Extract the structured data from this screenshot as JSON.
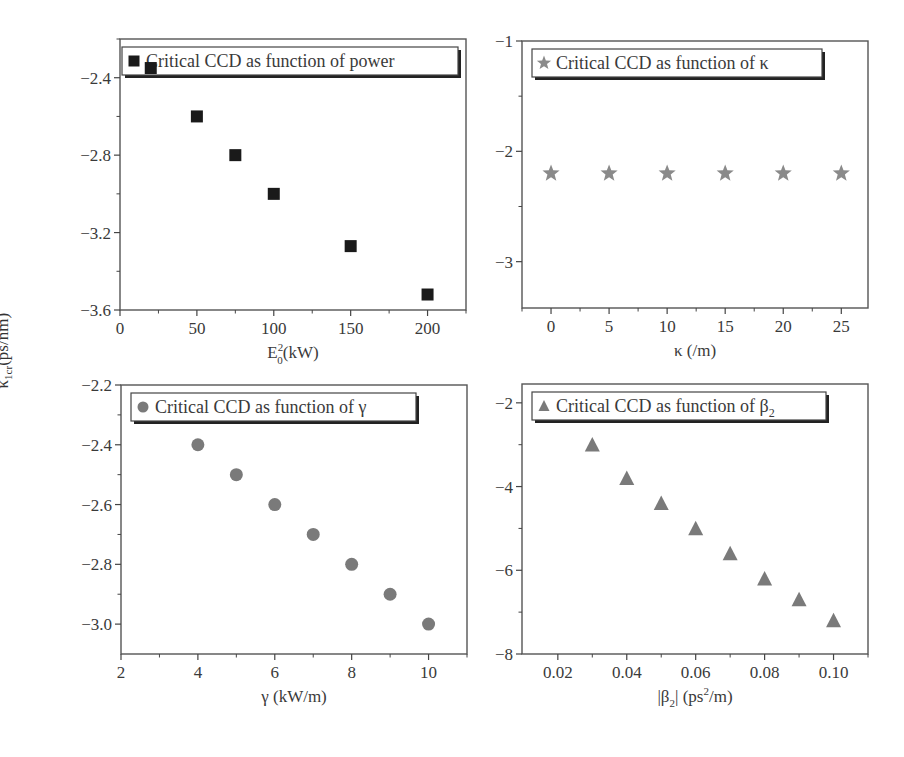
{
  "figure": {
    "shared_ylabel": "κ 1cr(ps/nm)",
    "shared_ylabel_main": "κ",
    "shared_ylabel_sub": "1cr",
    "shared_ylabel_unit": "(ps/nm)"
  },
  "chart_data": [
    {
      "id": "power",
      "type": "scatter",
      "title": "",
      "legend": "Critical CCD as function of power",
      "marker": "square",
      "marker_color": "#1a1a1a",
      "xlabel": "E0²(kW)",
      "xlabel_parts": {
        "base": "E",
        "sub": "0",
        "sup": "2",
        "rest": "(kW)"
      },
      "ylabel": "κ1cr(ps/nm)",
      "x": [
        20,
        50,
        75,
        100,
        150,
        200
      ],
      "y": [
        -2.35,
        -2.6,
        -2.8,
        -3.0,
        -3.27,
        -3.52
      ],
      "xlim": [
        0,
        225
      ],
      "ylim": [
        -3.6,
        -2.2
      ],
      "xticks": [
        0,
        50,
        100,
        150,
        200
      ],
      "xtick_labels": [
        "0",
        "50",
        "100",
        "150",
        "200"
      ],
      "xminor": [
        25,
        75,
        125,
        175,
        225
      ],
      "yticks": [
        -2.4,
        -2.8,
        -3.2,
        -3.6
      ],
      "ytick_labels": [
        "-2.4",
        "-2.8",
        "-3.2",
        "-3.6"
      ],
      "yminor": [
        -2.2,
        -2.6,
        -3.0,
        -3.4
      ],
      "grid": false,
      "legend_position": "top-left",
      "frame": {
        "left": 120,
        "top": 39,
        "right": 466,
        "bottom": 310
      }
    },
    {
      "id": "kappa",
      "type": "scatter",
      "title": "",
      "legend": "Critical CCD as function of κ",
      "marker": "star",
      "marker_color": "#8a8a8a",
      "xlabel": "κ (/m)",
      "ylabel": "κ1cr(ps/nm)",
      "x": [
        0,
        5,
        10,
        15,
        20,
        25
      ],
      "y": [
        -2.2,
        -2.2,
        -2.2,
        -2.2,
        -2.2,
        -2.2
      ],
      "xlim": [
        -2.5,
        27.3
      ],
      "ylim": [
        -3.42,
        -1.0
      ],
      "xticks": [
        0,
        5,
        10,
        15,
        20,
        25
      ],
      "xtick_labels": [
        "0",
        "5",
        "10",
        "15",
        "20",
        "25"
      ],
      "xminor": [
        -2.5,
        2.5,
        7.5,
        12.5,
        17.5,
        22.5
      ],
      "yticks": [
        -1,
        -2,
        -3
      ],
      "ytick_labels": [
        "-1",
        "-2",
        "-3"
      ],
      "yminor": [
        -1.5,
        -2.5
      ],
      "grid": false,
      "legend_position": "top-left",
      "frame": {
        "left": 522,
        "top": 41,
        "right": 868,
        "bottom": 308
      }
    },
    {
      "id": "gamma",
      "type": "scatter",
      "title": "",
      "legend": "Critical CCD as function of γ",
      "marker": "circle",
      "marker_color": "#7a7a7a",
      "xlabel": "γ (kW/m)",
      "ylabel": "κ1cr(ps/nm)",
      "x": [
        4,
        5,
        6,
        7,
        8,
        9,
        10
      ],
      "y": [
        -2.4,
        -2.5,
        -2.6,
        -2.7,
        -2.8,
        -2.9,
        -3.0
      ],
      "xlim": [
        2,
        11
      ],
      "ylim": [
        -3.1,
        -2.2
      ],
      "xticks": [
        2,
        4,
        6,
        8,
        10
      ],
      "xtick_labels": [
        "2",
        "4",
        "6",
        "8",
        "10"
      ],
      "xminor": [
        3,
        5,
        7,
        9,
        11
      ],
      "yticks": [
        -2.2,
        -2.4,
        -2.6,
        -2.8,
        -3.0
      ],
      "ytick_labels": [
        "-2.2",
        "-2.4",
        "-2.6",
        "-2.8",
        "-3.0"
      ],
      "yminor": [
        -2.3,
        -2.5,
        -2.7,
        -2.9
      ],
      "grid": false,
      "legend_position": "top-left",
      "frame": {
        "left": 121,
        "top": 385,
        "right": 467,
        "bottom": 654
      }
    },
    {
      "id": "beta2",
      "type": "scatter",
      "title": "",
      "legend": "Critical CCD as function of β2",
      "legend_parts": {
        "base": "Critical CCD as function of β",
        "sub": "2"
      },
      "marker": "triangle",
      "marker_color": "#7a7a7a",
      "xlabel": "|β2| (ps²/m)",
      "ylabel": "κ1cr(ps/nm)",
      "x": [
        0.03,
        0.04,
        0.05,
        0.06,
        0.07,
        0.08,
        0.09,
        0.1
      ],
      "y": [
        -3.0,
        -3.8,
        -4.4,
        -5.0,
        -5.6,
        -6.2,
        -6.7,
        -7.2
      ],
      "xlim": [
        0.0096,
        0.11
      ],
      "ylim": [
        -8.0,
        -1.55
      ],
      "xticks": [
        0.02,
        0.04,
        0.06,
        0.08,
        0.1
      ],
      "xtick_labels": [
        "0.02",
        "0.04",
        "0.06",
        "0.08",
        "0.10"
      ],
      "xminor": [
        0.03,
        0.05,
        0.07,
        0.09,
        0.11
      ],
      "yticks": [
        -2,
        -4,
        -6,
        -8
      ],
      "ytick_labels": [
        "-2",
        "-4",
        "-6",
        "-8"
      ],
      "yminor": [
        -3,
        -5,
        -7
      ],
      "grid": false,
      "legend_position": "top-left",
      "frame": {
        "left": 522,
        "top": 384,
        "right": 868,
        "bottom": 654
      }
    }
  ]
}
